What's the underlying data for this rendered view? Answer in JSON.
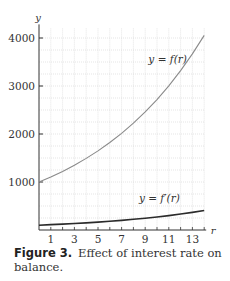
{
  "chart_data": {
    "type": "line",
    "title": "",
    "xlabel": "r",
    "ylabel": "y",
    "xlim": [
      0,
      14
    ],
    "ylim": [
      0,
      4000
    ],
    "x_ticks": [
      1,
      3,
      5,
      7,
      9,
      11,
      13
    ],
    "y_ticks": [
      1000,
      2000,
      3000,
      4000
    ],
    "grid": true,
    "series": [
      {
        "name": "y = f(r)",
        "color": "#8a8a8a",
        "x": [
          0,
          1,
          2,
          3,
          4,
          5,
          6,
          7,
          8,
          9,
          10,
          11,
          12,
          13,
          14
        ],
        "values": [
          1000,
          1105,
          1221,
          1350,
          1492,
          1649,
          1822,
          2014,
          2226,
          2460,
          2718,
          3004,
          3320,
          3669,
          4055
        ]
      },
      {
        "name": "y = f′(r)",
        "color": "#2b2b2b",
        "x": [
          0,
          1,
          2,
          3,
          4,
          5,
          6,
          7,
          8,
          9,
          10,
          11,
          12,
          13,
          14
        ],
        "values": [
          100,
          111,
          122,
          135,
          149,
          165,
          182,
          201,
          223,
          246,
          272,
          300,
          332,
          367,
          406
        ]
      }
    ],
    "annotations": [
      {
        "text": "y = f(r)",
        "x": 10.9,
        "y": 3480
      },
      {
        "text": "y = f′(r)",
        "x": 10.2,
        "y": 590
      }
    ]
  },
  "caption": {
    "figure_number": "Figure 3.",
    "text": "Effect of interest rate on balance."
  }
}
